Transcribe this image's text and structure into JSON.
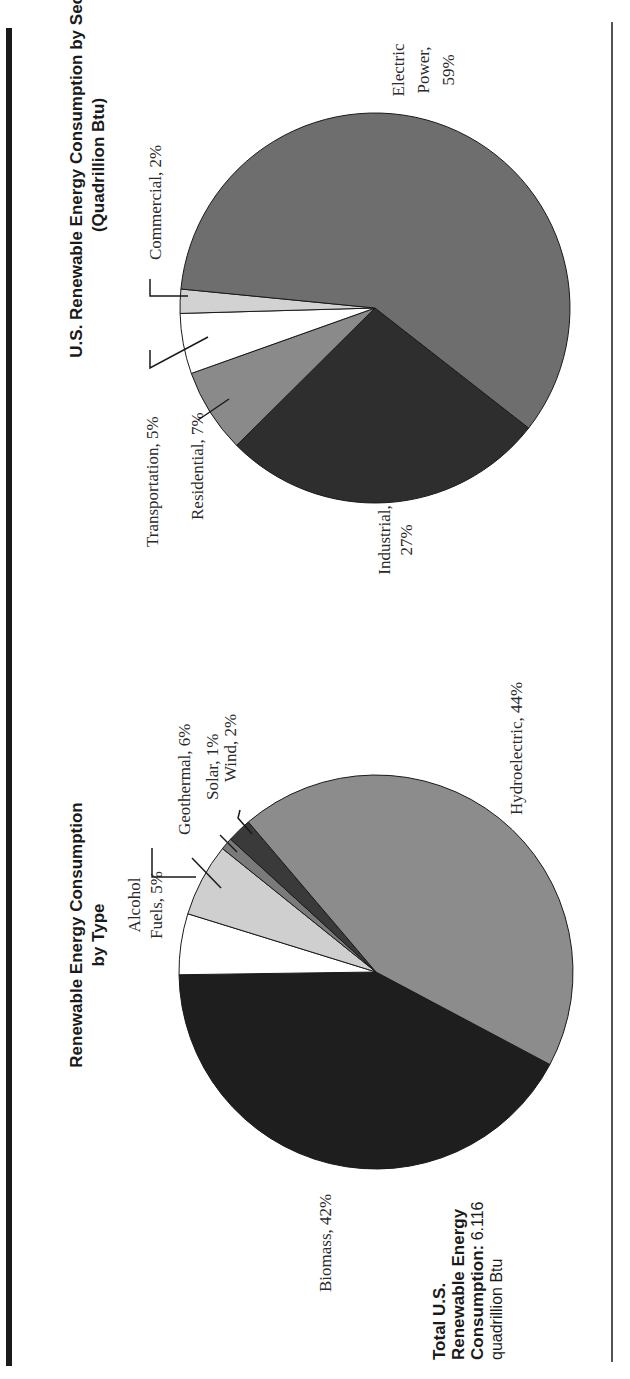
{
  "chart_data": [
    {
      "type": "pie",
      "title": "Renewable Energy Consumption by Type",
      "title_lines": [
        "Renewable Energy Consumption",
        "by Type"
      ],
      "categories": [
        "Biomass",
        "Alcohol Fuels",
        "Geothermal",
        "Solar",
        "Wind",
        "Hydroelectric"
      ],
      "values": [
        42,
        5,
        6,
        1,
        2,
        44
      ],
      "unit": "%",
      "colors": [
        "#1e1e1e",
        "#ffffff",
        "#cfcfcf",
        "#7a7a7a",
        "#3a3a3a",
        "#8c8c8c"
      ],
      "labels": {
        "biomass": "Biomass, 42%",
        "alcohol_line1": "Alcohol",
        "alcohol_line2": "Fuels, 5%",
        "geothermal": "Geothermal, 6%",
        "solar": "Solar, 1%",
        "wind": "Wind, 2%",
        "hydroelectric": "Hydroelectric, 44%"
      }
    },
    {
      "type": "pie",
      "title": "U.S. Renewable Energy Consumption by Sector (Quadrillion Btu)",
      "title_lines": [
        "U.S. Renewable Energy Consumption by Sector",
        "(Quadrillion Btu)"
      ],
      "categories": [
        "Industrial",
        "Residential",
        "Transportation",
        "Commercial",
        "Electric Power"
      ],
      "values": [
        27,
        7,
        5,
        2,
        59
      ],
      "unit": "%",
      "colors": [
        "#2e2e2e",
        "#8a8a8a",
        "#ffffff",
        "#d2d2d2",
        "#6e6e6e"
      ],
      "labels": {
        "industrial_line1": "Industrial,",
        "industrial_line2": "27%",
        "residential": "Residential, 7%",
        "transportation": "Transportation, 5%",
        "commercial": "Commercial, 2%",
        "electric_line1": "Electric",
        "electric_line2": "Power,",
        "electric_line3": "59%"
      }
    }
  ],
  "total": {
    "line1": "Total U.S.",
    "line2": "Renewable Energy",
    "line3_bold": "Consumption:",
    "line3_value": " 6.116",
    "line4": "quadrillion Btu"
  },
  "layout": {
    "type_pie": {
      "cx": 376,
      "cy": 972,
      "r": 197,
      "start_deg": 28
    },
    "sector_pie": {
      "cx": 375,
      "cy": 308,
      "r": 195,
      "start_deg": 38
    }
  }
}
